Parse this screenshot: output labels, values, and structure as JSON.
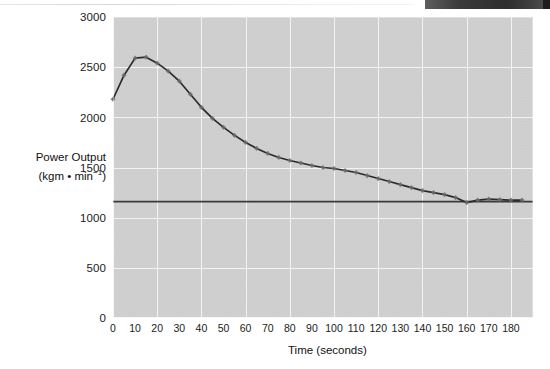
{
  "chart_data": {
    "type": "line",
    "title": "",
    "xlabel": "Time (seconds)",
    "ylabel": "Power Output (kgm • min−1)",
    "ylabel_line1": "Power Output",
    "ylabel_line2_prefix": "(kgm • min",
    "ylabel_line2_sup": "−1",
    "ylabel_line2_suffix": ")",
    "xlim": [
      0,
      190
    ],
    "ylim": [
      0,
      3000
    ],
    "grid": true,
    "legend": "none",
    "xticks": [
      0,
      10,
      20,
      30,
      40,
      50,
      60,
      70,
      80,
      90,
      100,
      110,
      120,
      130,
      140,
      150,
      160,
      170,
      180
    ],
    "yticks": [
      0,
      500,
      1000,
      1500,
      2000,
      2500,
      3000
    ],
    "series": [
      {
        "name": "Power Output",
        "marker": "diamond",
        "color": "#2b2b2b",
        "x": [
          0,
          5,
          10,
          15,
          20,
          25,
          30,
          35,
          40,
          45,
          50,
          55,
          60,
          65,
          70,
          75,
          80,
          85,
          90,
          95,
          100,
          105,
          110,
          115,
          120,
          125,
          130,
          135,
          140,
          145,
          150,
          155,
          160,
          165,
          170,
          175,
          180,
          185
        ],
        "y": [
          2180,
          2420,
          2590,
          2600,
          2540,
          2460,
          2360,
          2230,
          2100,
          1990,
          1900,
          1820,
          1750,
          1690,
          1640,
          1600,
          1570,
          1545,
          1520,
          1500,
          1490,
          1470,
          1450,
          1420,
          1390,
          1360,
          1330,
          1300,
          1270,
          1250,
          1230,
          1200,
          1150,
          1175,
          1185,
          1180,
          1175,
          1175
        ]
      }
    ],
    "reference_line": {
      "name": "steady-state reference",
      "orientation": "horizontal",
      "value": 1160,
      "color": "#3a3a3a"
    }
  },
  "axes": {
    "y_tick_labels": [
      "3000",
      "2500",
      "2000",
      "1500",
      "1000",
      "500",
      "0"
    ],
    "x_tick_labels": [
      "0",
      "10",
      "20",
      "30",
      "40",
      "50",
      "60",
      "70",
      "80",
      "90",
      "100",
      "110",
      "120",
      "130",
      "140",
      "150",
      "160",
      "170",
      "180"
    ]
  },
  "colors": {
    "plot_background": "#d2d2d2",
    "grid": "#f3f3f3",
    "curve": "#2b2b2b",
    "marker": "#6e6e6e",
    "reference_line": "#3a3a3a",
    "text": "#1b1b1b",
    "page_background": "#ffffff"
  }
}
